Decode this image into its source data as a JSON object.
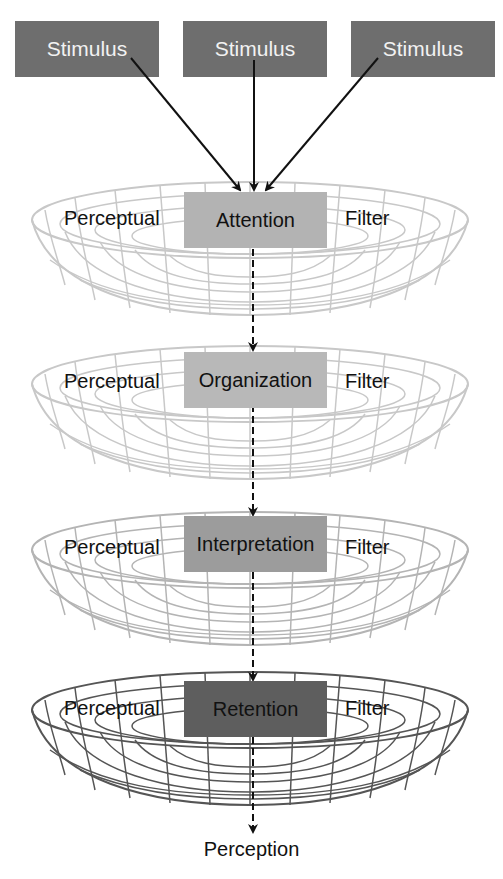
{
  "stimuli": [
    {
      "label": "Stimulus"
    },
    {
      "label": "Stimulus"
    },
    {
      "label": "Stimulus"
    }
  ],
  "filters": [
    {
      "left_label": "Perceptual",
      "stage": "Attention",
      "right_label": "Filter",
      "box_color": "#b3b3b3",
      "bowl_color": "#c8c8c8"
    },
    {
      "left_label": "Perceptual",
      "stage": "Organization",
      "right_label": "Filter",
      "box_color": "#b8b8b8",
      "bowl_color": "#c8c8c8"
    },
    {
      "left_label": "Perceptual",
      "stage": "Interpretation",
      "right_label": "Filter",
      "box_color": "#9c9c9c",
      "bowl_color": "#b4b4b4"
    },
    {
      "left_label": "Perceptual",
      "stage": "Retention",
      "right_label": "Filter",
      "box_color": "#5e5e5e",
      "bowl_color": "#555555"
    }
  ],
  "output": {
    "label": "Perception"
  },
  "colors": {
    "stimulus_box": "#6e6e6e",
    "arrow": "#111111"
  }
}
